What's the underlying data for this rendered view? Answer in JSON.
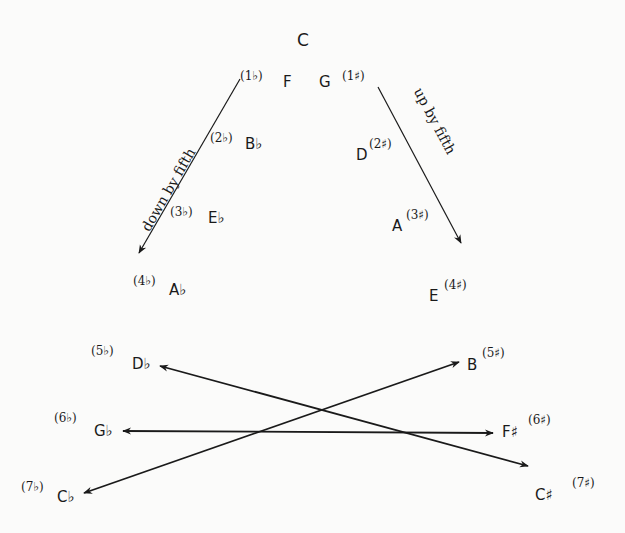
{
  "header": {
    "title_fragment": ""
  },
  "center": {
    "note": "C"
  },
  "arrows": {
    "down_label": "down by fifth",
    "up_label": "up by fifth"
  },
  "flats": [
    {
      "note": "F",
      "num": "(1♭)"
    },
    {
      "note": "B♭",
      "num": "(2♭)"
    },
    {
      "note": "E♭",
      "num": "(3♭)"
    },
    {
      "note": "A♭",
      "num": "(4♭)"
    },
    {
      "note": "D♭",
      "num": "(5♭)"
    },
    {
      "note": "G♭",
      "num": "(6♭)"
    },
    {
      "note": "C♭",
      "num": "(7♭)"
    }
  ],
  "sharps": [
    {
      "note": "G",
      "num": "(1♯)"
    },
    {
      "note": "D",
      "num": "(2♯)"
    },
    {
      "note": "A",
      "num": "(3♯)"
    },
    {
      "note": "E",
      "num": "(4♯)"
    },
    {
      "note": "B",
      "num": "(5♯)"
    },
    {
      "note": "F♯",
      "num": "(6♯)"
    },
    {
      "note": "C♯",
      "num": "(7♯)"
    }
  ],
  "enharmonic_pairs": [
    {
      "from": "D♭",
      "to": "C♯"
    },
    {
      "from": "G♭",
      "to": "F♯"
    },
    {
      "from": "C♭",
      "to": "B"
    }
  ],
  "colors": {
    "ink": "#1a1a1a",
    "background": "#fbfbfa"
  }
}
